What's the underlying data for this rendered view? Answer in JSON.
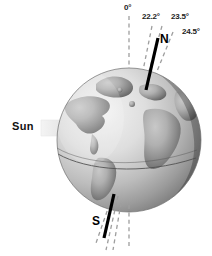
{
  "figure": {
    "background_color": "#ffffff"
  },
  "sun": {
    "label": "Sun",
    "arrow_icon": "right-arrow-icon",
    "arrow_color": "#e2e2e2"
  },
  "globe": {
    "name": "earth-globe",
    "ocean_light_color": "#e9e9e9",
    "ocean_dark_color": "#8f8f8f",
    "land_light_color": "#b9b9b9",
    "land_dark_color": "#6e6e6e",
    "outline_color": "#6a6a6a",
    "equator_line_color": "#4a4a4a"
  },
  "axis": {
    "solid_axis_color": "#000000",
    "dashed_line_color": "#9a9a9a",
    "north_pole_label": "N",
    "south_pole_label": "S"
  },
  "angles": [
    {
      "label": "0°",
      "style": "dashed",
      "role": "reference-vertical"
    },
    {
      "label": "22.2°",
      "style": "dashed",
      "role": "minimum-obliquity"
    },
    {
      "label": "23.5°",
      "style": "solid",
      "role": "current-obliquity"
    },
    {
      "label": "24.5°",
      "style": "dashed",
      "role": "maximum-obliquity"
    }
  ],
  "angle_labels": {
    "zero": "0°",
    "min": "22.2°",
    "current": "23.5°",
    "max": "24.5°"
  }
}
